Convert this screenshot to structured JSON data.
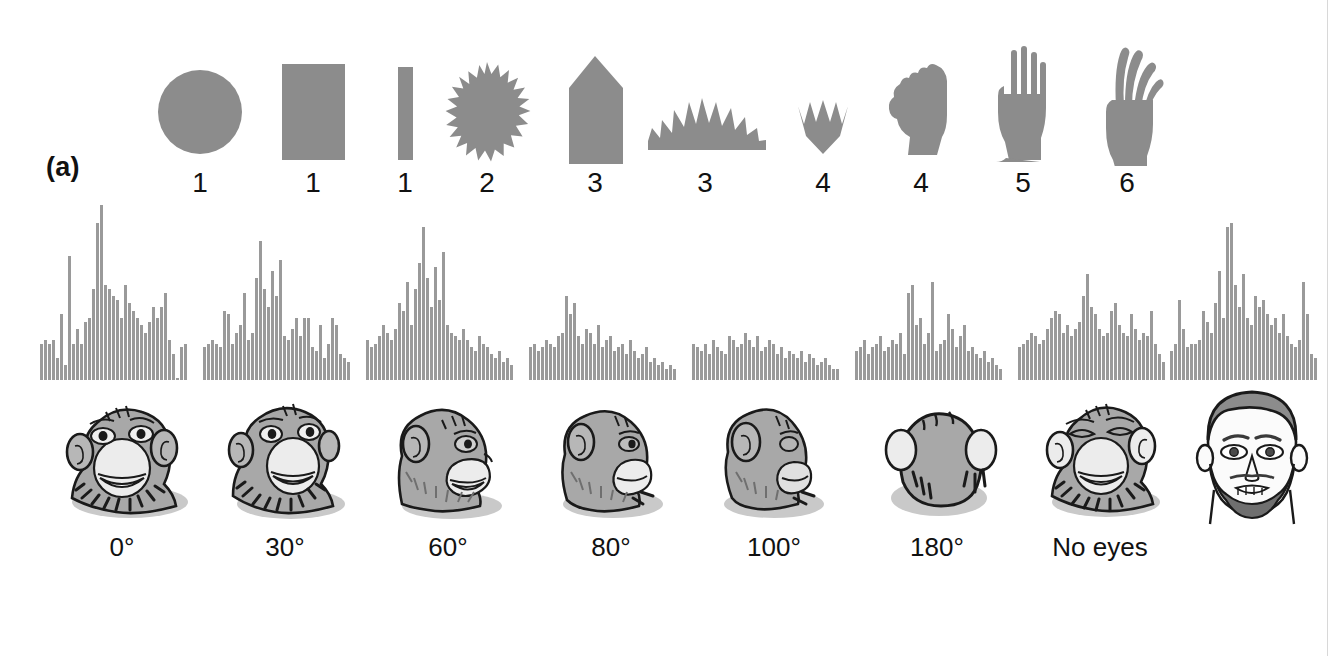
{
  "figure": {
    "panel_a_letter": "(a)",
    "panel_b_letter": "(b)",
    "shape_fill": "#8c8c8c",
    "bar_fill": "#9a9a9a",
    "face_fill": "#a8a8a8",
    "ink": "#111111"
  },
  "panel_a": {
    "caption_letter": "(a)",
    "stimuli": [
      {
        "name": "circle",
        "rating": "1",
        "icon": "circle-shape"
      },
      {
        "name": "rectangle",
        "rating": "1",
        "icon": "rectangle-shape"
      },
      {
        "name": "narrow-bar",
        "rating": "1",
        "icon": "narrow-bar-shape"
      },
      {
        "name": "starburst",
        "rating": "2",
        "icon": "starburst-shape"
      },
      {
        "name": "pointed-column",
        "rating": "3",
        "icon": "pointed-column-shape"
      },
      {
        "name": "half-starburst",
        "rating": "3",
        "icon": "half-starburst-shape"
      },
      {
        "name": "jagged-crown",
        "rating": "4",
        "icon": "jagged-crown-shape"
      },
      {
        "name": "closed-fist",
        "rating": "4",
        "icon": "closed-fist-shape"
      },
      {
        "name": "open-hand",
        "rating": "5",
        "icon": "open-hand-shape"
      },
      {
        "name": "curved-hand",
        "rating": "6",
        "icon": "curved-hand-shape"
      }
    ]
  },
  "panel_b": {
    "caption_letter": "(b)",
    "stimuli": [
      {
        "label": "0°",
        "face": "monkey-face-front"
      },
      {
        "label": "30°",
        "face": "monkey-face-30"
      },
      {
        "label": "60°",
        "face": "monkey-face-60"
      },
      {
        "label": "80°",
        "face": "monkey-face-80"
      },
      {
        "label": "100°",
        "face": "monkey-face-100"
      },
      {
        "label": "180°",
        "face": "monkey-head-back"
      },
      {
        "label": "No eyes",
        "face": "monkey-face-no-eyes"
      },
      {
        "label": "",
        "face": "human-face-front"
      }
    ]
  },
  "chart_data": {
    "type": "bar",
    "title": "",
    "subtitle": "Peri-stimulus time histograms of neuronal response to face stimuli at varying view angles",
    "xlabel": "",
    "ylabel": "",
    "grid": false,
    "legend": false,
    "ylim": [
      0,
      100
    ],
    "note": "Eight peri-stimulus time histograms, one per stimulus condition. Values are relative spike counts per time bin (0-100 scale, normalized to the tallest bin across all panels).",
    "series": [
      {
        "name": "0°",
        "values": [
          20,
          22,
          20,
          22,
          12,
          36,
          8,
          68,
          20,
          28,
          20,
          32,
          34,
          50,
          86,
          96,
          52,
          50,
          46,
          44,
          34,
          52,
          42,
          38,
          34,
          30,
          26,
          32,
          40,
          34,
          40,
          48,
          22,
          14,
          0,
          18,
          20
        ]
      },
      {
        "name": "30°",
        "values": [
          18,
          20,
          22,
          20,
          18,
          38,
          36,
          20,
          26,
          30,
          48,
          22,
          26,
          56,
          76,
          50,
          40,
          60,
          46,
          66,
          24,
          22,
          28,
          34,
          24,
          34,
          34,
          18,
          16,
          30,
          12,
          20,
          34,
          30,
          14,
          12,
          10
        ]
      },
      {
        "name": "60°",
        "values": [
          22,
          18,
          20,
          24,
          30,
          26,
          22,
          28,
          42,
          38,
          54,
          30,
          50,
          64,
          84,
          56,
          40,
          62,
          44,
          70,
          30,
          26,
          24,
          22,
          28,
          22,
          18,
          16,
          24,
          20,
          18,
          14,
          12,
          16,
          10,
          12,
          8
        ]
      },
      {
        "name": "80°",
        "values": [
          18,
          20,
          16,
          18,
          22,
          20,
          18,
          24,
          26,
          46,
          36,
          42,
          24,
          20,
          28,
          26,
          20,
          30,
          18,
          22,
          24,
          16,
          18,
          20,
          14,
          22,
          16,
          12,
          14,
          18,
          10,
          12,
          8,
          10,
          6,
          8,
          6
        ]
      },
      {
        "name": "100°",
        "values": [
          20,
          18,
          16,
          20,
          14,
          22,
          18,
          16,
          14,
          24,
          22,
          18,
          20,
          26,
          22,
          18,
          24,
          16,
          18,
          22,
          20,
          14,
          18,
          12,
          16,
          14,
          12,
          16,
          10,
          14,
          12,
          8,
          10,
          12,
          8,
          6,
          6
        ]
      },
      {
        "name": "180°",
        "values": [
          16,
          18,
          22,
          14,
          18,
          20,
          24,
          16,
          18,
          22,
          20,
          26,
          14,
          48,
          52,
          30,
          34,
          20,
          26,
          54,
          16,
          20,
          22,
          36,
          28,
          18,
          24,
          30,
          16,
          18,
          14,
          12,
          16,
          10,
          12,
          8,
          6
        ]
      },
      {
        "name": "No eyes",
        "values": [
          18,
          20,
          22,
          26,
          24,
          20,
          22,
          28,
          34,
          38,
          36,
          26,
          30,
          24,
          28,
          32,
          46,
          58,
          40,
          36,
          28,
          24,
          26,
          38,
          42,
          30,
          26,
          24,
          36,
          28,
          22,
          26,
          24,
          38,
          20,
          14,
          10
        ]
      },
      {
        "name": "human-face",
        "values": [
          16,
          20,
          44,
          28,
          18,
          20,
          20,
          22,
          38,
          32,
          26,
          42,
          60,
          34,
          84,
          86,
          52,
          40,
          58,
          34,
          30,
          46,
          40,
          44,
          36,
          30,
          34,
          26,
          36,
          24,
          20,
          18,
          22,
          54,
          36,
          14,
          12
        ]
      }
    ]
  }
}
